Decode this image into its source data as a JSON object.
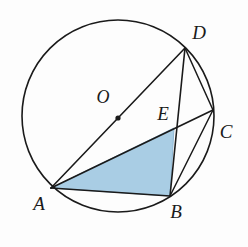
{
  "figure": {
    "background_color": "#fdfdfd",
    "stroke_color": "#1a1a1a",
    "shaded_fill_color": "#a9cde4",
    "shaded_fill_edge_color": "#8fb8d4"
  },
  "circle": {
    "name": "circumcircle",
    "center_x": 118,
    "center_y": 116,
    "radius": 96,
    "stroke_width": 1.6
  },
  "center_point": {
    "label": "O",
    "x": 118,
    "y": 118,
    "dot_radius": 2.6,
    "label_x": 103,
    "label_y": 99
  },
  "points": [
    {
      "id": "A",
      "label": "A",
      "x": 51,
      "y": 188,
      "label_x": 39,
      "label_y": 206
    },
    {
      "id": "B",
      "label": "B",
      "x": 170,
      "y": 196,
      "label_x": 176,
      "label_y": 214
    },
    {
      "id": "C",
      "label": "C",
      "x": 213,
      "y": 110,
      "label_x": 226,
      "label_y": 134
    },
    {
      "id": "D",
      "label": "D",
      "x": 185,
      "y": 48,
      "label_x": 199,
      "label_y": 35
    },
    {
      "id": "E",
      "label": "E",
      "x": 174,
      "y": 128,
      "label_x": 163,
      "label_y": 116
    }
  ],
  "segments": [
    {
      "id": "AD",
      "from": "A",
      "to": "D",
      "description": "diameter through O"
    },
    {
      "id": "AC",
      "from": "A",
      "to": "C",
      "description": "chord through E"
    },
    {
      "id": "AB",
      "from": "A",
      "to": "B",
      "description": "chord"
    },
    {
      "id": "DB",
      "from": "D",
      "to": "B",
      "description": "chord through E"
    },
    {
      "id": "DC",
      "from": "D",
      "to": "C",
      "description": "chord"
    },
    {
      "id": "BC",
      "from": "B",
      "to": "C",
      "description": "chord"
    }
  ],
  "shaded_region": {
    "name": "triangle-AEB",
    "vertices": [
      "A",
      "E",
      "B"
    ],
    "points_path": "51,188 174,128 170,196"
  }
}
